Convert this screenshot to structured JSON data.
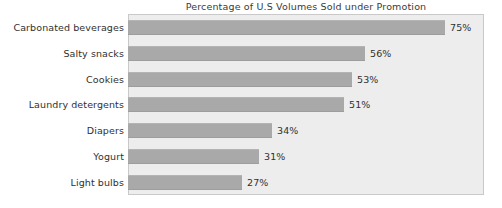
{
  "chart_data": {
    "type": "bar",
    "orientation": "horizontal",
    "title": "Percentage of U.S Volumes Sold under Promotion",
    "xlabel": "",
    "ylabel": "",
    "xlim": [
      0,
      75
    ],
    "grid": false,
    "legend": null,
    "value_suffix": "%",
    "categories": [
      "Carbonated beverages",
      "Salty snacks",
      "Cookies",
      "Laundry detergents",
      "Diapers",
      "Yogurt",
      "Light bulbs"
    ],
    "values": [
      75,
      56,
      53,
      51,
      34,
      31,
      27
    ],
    "value_labels": [
      "75%",
      "56%",
      "53%",
      "51%",
      "34%",
      "31%",
      "27%"
    ],
    "colors": {
      "bar_fill": "#a9a9a9",
      "plot_background": "#ededed",
      "plot_border": "#c9c9c9",
      "page_background": "#ffffff",
      "text": "#303030"
    }
  }
}
